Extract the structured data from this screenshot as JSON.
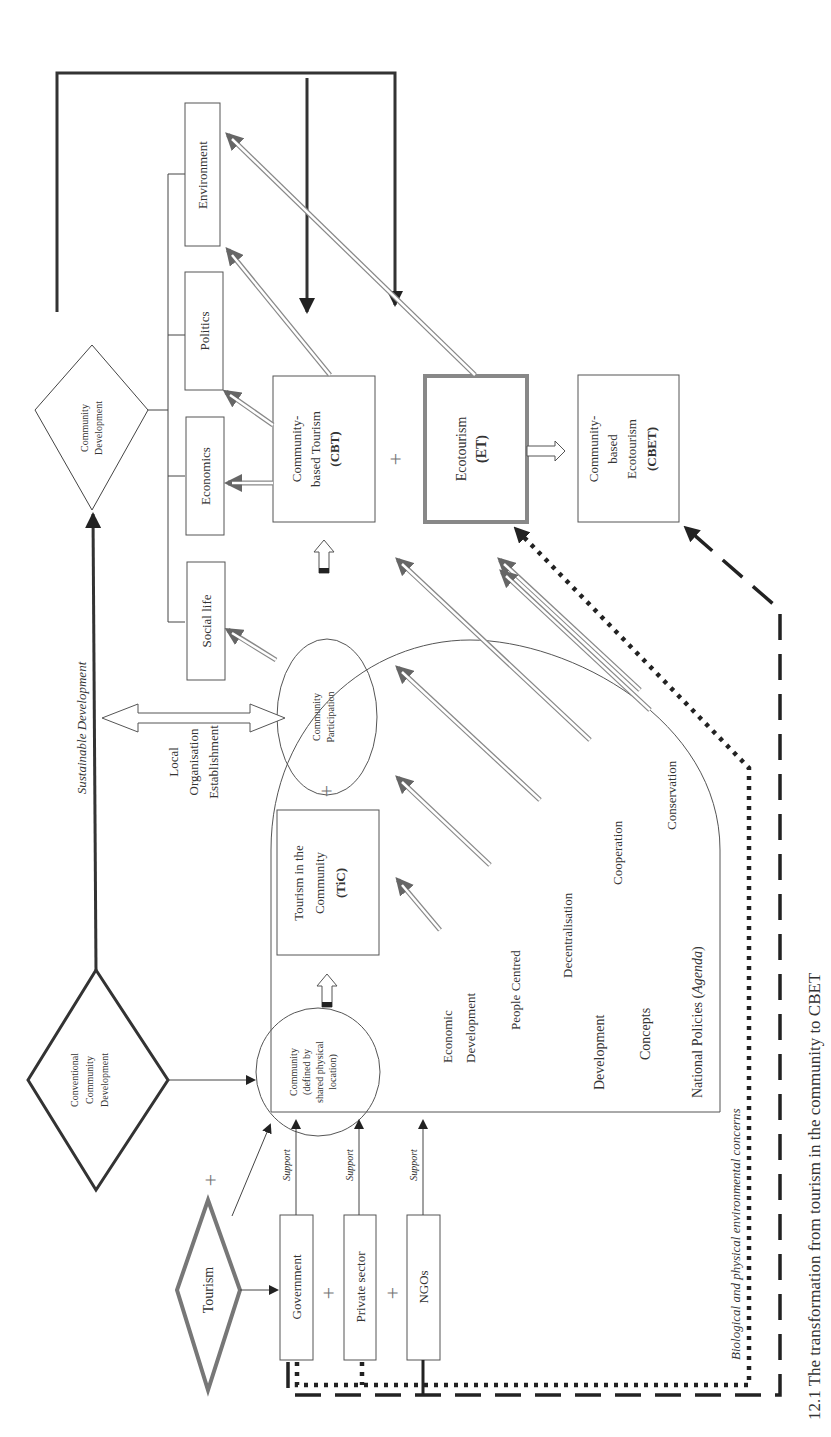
{
  "diagram": {
    "sustainable_development": "Sustainable Development",
    "community_development": [
      "Community",
      "Development"
    ],
    "conventional_cd": [
      "Conventional",
      "Community",
      "Development"
    ],
    "outcomes": {
      "social_life": "Social life",
      "economics": "Economics",
      "politics": "Politics",
      "environment": "Environment"
    },
    "cbt": [
      "Community-",
      "based Tourism",
      "(CBT)"
    ],
    "et": [
      "Ecotourism",
      "(ET)"
    ],
    "cbet": [
      "Community-",
      "based",
      "Ecotourism",
      "(CBET)"
    ],
    "tic": [
      "Tourism in the",
      "Community",
      "(TiC)"
    ],
    "community_participation": [
      "Community",
      "Participation"
    ],
    "community_location": [
      "Community",
      "(defined by",
      "shared physical",
      "location)"
    ],
    "local_org": [
      "Local",
      "Organisation",
      "Establishment"
    ],
    "tourism": "Tourism",
    "stakeholders": {
      "government": "Government",
      "private_sector": "Private sector",
      "ngos": "NGOs"
    },
    "support_label": "Support",
    "policy_concepts": {
      "economic_development": [
        "Economic",
        "Development"
      ],
      "people_centred": "People Centred",
      "decentralisation": "Decentralisation",
      "development": "Development",
      "cooperation": "Cooperation",
      "concepts": "Concepts",
      "conservation": "Conservation",
      "national_policies": "National Policies (",
      "agenda": "Agenda",
      "close_paren": ")"
    },
    "environmental_concerns": "Biological and physical environmental concerns",
    "plus_symbol": "+",
    "caption": "12.1 The transformation from tourism in the community to CBET"
  }
}
